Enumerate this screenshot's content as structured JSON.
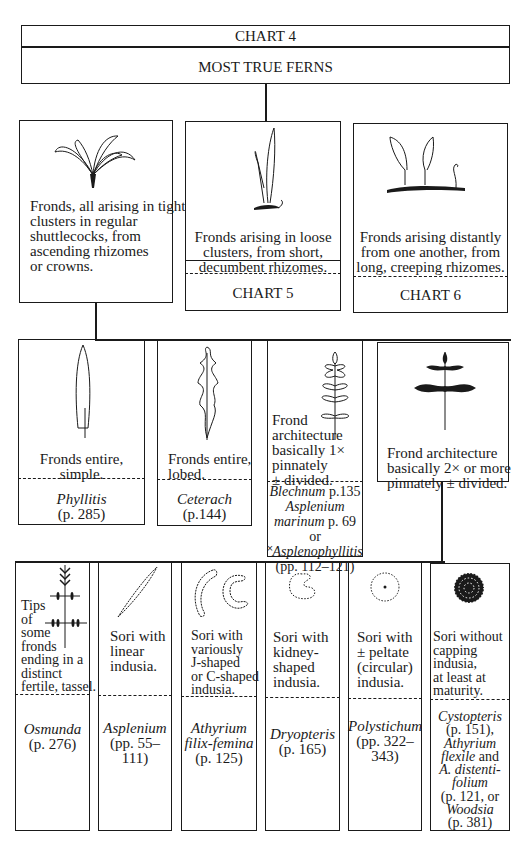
{
  "header": {
    "chart_label": "CHART 4",
    "title": "MOST TRUE FERNS"
  },
  "level1": [
    {
      "description": [
        "Fronds, all arising in tight",
        "clusters in regular",
        "shuttlecocks, from",
        "ascending rhizomes",
        "or crowns."
      ],
      "illustration": "shuttlecock-fronds-icon"
    },
    {
      "description": [
        "Fronds arising in loose",
        "clusters, from short,",
        "decumbent rhizomes."
      ],
      "target": "CHART 5",
      "illustration": "loose-cluster-fronds-icon"
    },
    {
      "description": [
        "Fronds arising distantly",
        "from one another, from",
        "long, creeping rhizomes."
      ],
      "target": "CHART 6",
      "illustration": "creeping-rhizome-fronds-icon"
    }
  ],
  "level2": [
    {
      "description": [
        "Fronds entire,",
        "simple."
      ],
      "genus": "Phyllitis",
      "pages": "(p. 285)",
      "illustration": "simple-frond-icon"
    },
    {
      "description": [
        "Fronds entire,",
        "lobed."
      ],
      "genus": "Ceterach",
      "pages": "(p.144)",
      "illustration": "lobed-frond-icon"
    },
    {
      "description": [
        "Frond",
        "architecture",
        "basically 1×",
        "pinnately",
        "± divided."
      ],
      "result_lines": [
        {
          "italic": "Blechnum",
          "plain": " p.135"
        },
        {
          "italic": "Asplenium",
          "plain": ""
        },
        {
          "italic": "marinum",
          "plain": " p. 69 or"
        },
        {
          "italic": "˟Asplenophyllitis",
          "plain": ""
        },
        {
          "italic": "",
          "plain": "(pp. 112–121)"
        }
      ],
      "illustration": "pinnate-frond-icon"
    },
    {
      "description": [
        "Frond architecture",
        "basically 2× or more",
        "pinnately ± divided."
      ],
      "illustration": "bipinnate-frond-icon"
    }
  ],
  "level3": [
    {
      "description": [
        "Tips",
        "of",
        "some",
        "fronds",
        "ending in a",
        "distinct",
        "fertile, tassel."
      ],
      "result_lines": [
        {
          "italic": "Osmunda",
          "plain": ""
        },
        {
          "italic": "",
          "plain": "(p. 276)"
        }
      ],
      "illustration": "fertile-tassel-icon"
    },
    {
      "description": [
        "Sori with",
        "linear",
        "indusia."
      ],
      "result_lines": [
        {
          "italic": "Asplenium",
          "plain": ""
        },
        {
          "italic": "",
          "plain": "(pp. 55–"
        },
        {
          "italic": "",
          "plain": "111)"
        }
      ],
      "illustration": "linear-sorus-icon"
    },
    {
      "description": [
        "Sori with",
        "variously",
        "J-shaped",
        "or C-shaped",
        "indusia."
      ],
      "result_lines": [
        {
          "italic": "Athyrium",
          "plain": ""
        },
        {
          "italic": "filix-femina",
          "plain": ""
        },
        {
          "italic": "",
          "plain": "(p. 125)"
        }
      ],
      "illustration": "j-c-shaped-sorus-icon"
    },
    {
      "description": [
        "Sori with",
        "kidney-",
        "shaped",
        "indusia."
      ],
      "result_lines": [
        {
          "italic": "Dryopteris",
          "plain": ""
        },
        {
          "italic": "",
          "plain": "(p. 165)"
        }
      ],
      "illustration": "kidney-sorus-icon"
    },
    {
      "description": [
        "Sori with",
        "± peltate",
        "(circular)",
        "indusia."
      ],
      "result_lines": [
        {
          "italic": "Polystichum",
          "plain": ""
        },
        {
          "italic": "",
          "plain": "(pp. 322–"
        },
        {
          "italic": "",
          "plain": "343)"
        }
      ],
      "illustration": "peltate-sorus-icon"
    },
    {
      "description": [
        "Sori without",
        "capping",
        "indusia,",
        "at least at",
        "maturity."
      ],
      "result_lines": [
        {
          "italic": "Cystopteris",
          "plain": ""
        },
        {
          "italic": "",
          "plain": "(p. 151),"
        },
        {
          "italic": "Athyrium",
          "plain": ""
        },
        {
          "italic": "flexile",
          "plain": " and"
        },
        {
          "italic": "A. distenti-",
          "plain": ""
        },
        {
          "italic": "folium",
          "plain": ""
        },
        {
          "italic": "",
          "plain": "(p. 121, or"
        },
        {
          "italic": "Woodsia",
          "plain": ""
        },
        {
          "italic": "",
          "plain": "(p. 381)"
        }
      ],
      "illustration": "naked-sorus-icon"
    }
  ]
}
